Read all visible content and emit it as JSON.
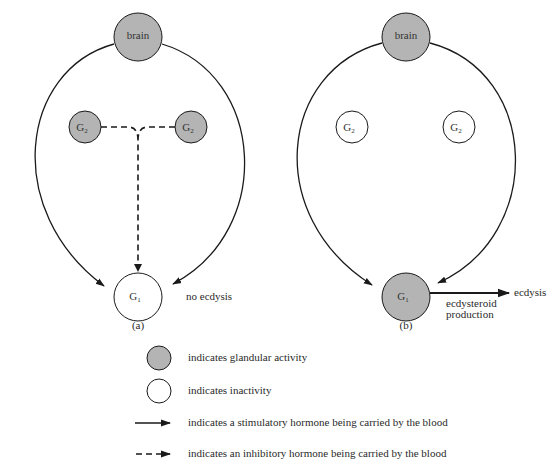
{
  "colors": {
    "active_fill": "#b4b4b4",
    "inactive_fill": "#ffffff",
    "stroke": "#1a1a1a",
    "text": "#2a2a2a"
  },
  "diagrams": [
    {
      "id": "a",
      "caption": "(a)",
      "nodes": {
        "brain": {
          "label": "brain",
          "state": "active"
        },
        "g2_left": {
          "label": "G",
          "sub": "2",
          "state": "active"
        },
        "g2_right": {
          "label": "G",
          "sub": "2",
          "state": "active"
        },
        "g1": {
          "label": "G",
          "sub": "1",
          "state": "inactive"
        }
      },
      "arrows": [
        {
          "from": "brain",
          "to": "g1",
          "type": "stimulatory",
          "path": "left arc"
        },
        {
          "from": "brain",
          "to": "g1",
          "type": "stimulatory",
          "path": "right arc"
        },
        {
          "from": "g2_left+g2_right",
          "to": "g1",
          "type": "inhibitory"
        }
      ],
      "outcome": "no ecdysis"
    },
    {
      "id": "b",
      "caption": "(b)",
      "nodes": {
        "brain": {
          "label": "brain",
          "state": "active"
        },
        "g2_left": {
          "label": "G",
          "sub": "2",
          "state": "inactive"
        },
        "g2_right": {
          "label": "G",
          "sub": "2",
          "state": "inactive"
        },
        "g1": {
          "label": "G",
          "sub": "1",
          "state": "active"
        }
      },
      "arrows": [
        {
          "from": "brain",
          "to": "g1",
          "type": "stimulatory",
          "path": "left arc"
        },
        {
          "from": "brain",
          "to": "g1",
          "type": "stimulatory",
          "path": "right arc"
        },
        {
          "from": "g1",
          "to": "ecdysis",
          "type": "stimulatory"
        }
      ],
      "arrow_label_line1": "ecdysteroid",
      "arrow_label_line2": "production",
      "outcome": "ecdysis"
    }
  ],
  "legend": [
    {
      "symbol": "filled-circle",
      "text": "indicates glandular activity"
    },
    {
      "symbol": "open-circle",
      "text": "indicates inactivity"
    },
    {
      "symbol": "solid-arrow",
      "text": "indicates a stimulatory hormone being carried by the blood"
    },
    {
      "symbol": "dashed-arrow",
      "text": "indicates an inhibitory hormone being carried by the blood"
    }
  ]
}
